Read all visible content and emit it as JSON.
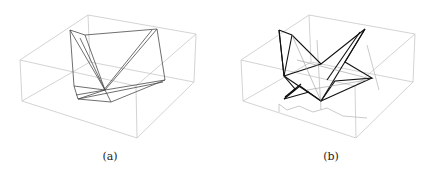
{
  "figure": {
    "panels": [
      {
        "id": "a",
        "caption": "(a)",
        "description": "Wireframe box containing a folded polygonal surface (flat-ish state)",
        "box_color": "#c8c8c8",
        "surface_color": "#444444"
      },
      {
        "id": "b",
        "caption": "(b)",
        "description": "Wireframe box containing a folded polygonal surface (crumpled state) with shadow projection",
        "box_color": "#c8c8c8",
        "surface_color": "#111111",
        "shadow_color": "#bdbdbd"
      }
    ]
  }
}
